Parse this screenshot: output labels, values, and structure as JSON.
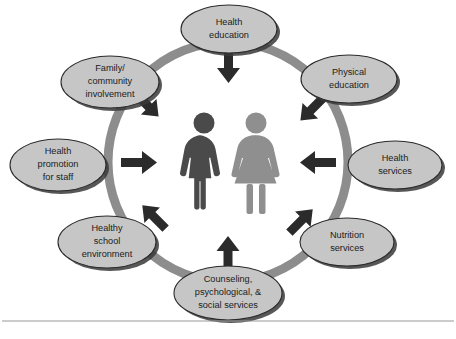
{
  "diagram": {
    "type": "circular-cycle",
    "center": {
      "figures": [
        {
          "name": "male-figure",
          "color": "#4a4a4a"
        },
        {
          "name": "female-figure",
          "color": "#8f8f8f"
        }
      ]
    },
    "ring": {
      "color": "#8d8d8d",
      "oval_fill": "#c6c6c6",
      "oval_stroke": "#2a2a2a",
      "arrow_color": "#2b2b2b"
    },
    "nodes": [
      {
        "id": "health-education",
        "lines": [
          "Health",
          "education"
        ],
        "position": "top",
        "arrow": "down"
      },
      {
        "id": "physical-education",
        "lines": [
          "Physical",
          "education"
        ],
        "position": "top-right",
        "arrow": "down-left"
      },
      {
        "id": "health-services",
        "lines": [
          "Health",
          "services"
        ],
        "position": "right",
        "arrow": "left"
      },
      {
        "id": "nutrition-services",
        "lines": [
          "Nutrition",
          "services"
        ],
        "position": "bottom-right",
        "arrow": "up-left"
      },
      {
        "id": "counseling-psychological-social-services",
        "lines": [
          "Counseling,",
          "psychological, &",
          "social services"
        ],
        "position": "bottom",
        "arrow": "up"
      },
      {
        "id": "healthy-school-environment",
        "lines": [
          "Healthy",
          "school",
          "environment"
        ],
        "position": "bottom-left",
        "arrow": "up-right"
      },
      {
        "id": "health-promotion-for-staff",
        "lines": [
          "Health",
          "promotion",
          "for staff"
        ],
        "position": "left",
        "arrow": "right"
      },
      {
        "id": "family-community-involvement",
        "lines": [
          "Family/",
          "community",
          "involvement"
        ],
        "position": "top-left",
        "arrow": "down-right"
      }
    ]
  }
}
